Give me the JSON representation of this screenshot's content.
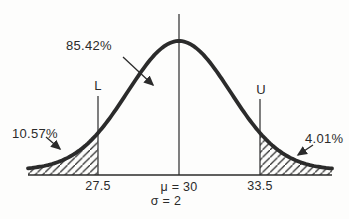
{
  "chart_data": {
    "type": "area",
    "subtype": "normal-distribution-curve",
    "title": "",
    "mu": 30,
    "sigma": 2,
    "lower_cutoff": 27.5,
    "upper_cutoff": 33.5,
    "regions": [
      {
        "name": "left-tail",
        "range": "x < 27.5",
        "percent": 10.57,
        "hatched": true
      },
      {
        "name": "middle",
        "range": "27.5 to 33.5",
        "percent": 85.42,
        "hatched": false
      },
      {
        "name": "right-tail",
        "range": "x > 33.5",
        "percent": 4.01,
        "hatched": true
      }
    ],
    "x_tick_labels": [
      "27.5",
      "μ = 30",
      "33.5"
    ],
    "axis_sub_label": "σ = 2",
    "bound_markers": [
      "L",
      "U"
    ],
    "grid": false,
    "legend": false
  },
  "labels": {
    "middle_percent": "85.42%",
    "left_percent": "10.57%",
    "right_percent": "4.01%",
    "lower_marker": "L",
    "upper_marker": "U",
    "lower_value": "27.5",
    "upper_value": "33.5",
    "mu": "μ = 30",
    "sigma": "σ = 2"
  },
  "colors": {
    "ink": "#2b2b2b",
    "background": "#fdfdfc"
  }
}
